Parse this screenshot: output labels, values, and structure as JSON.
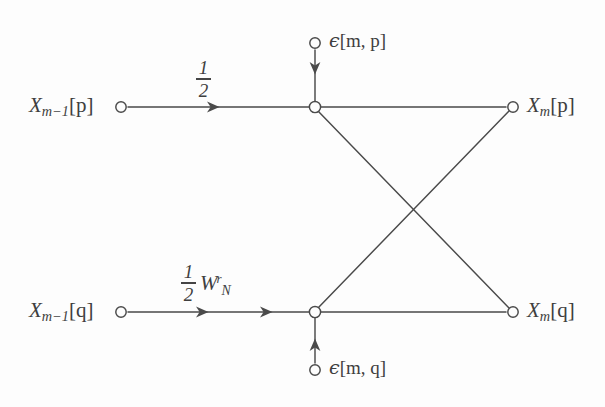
{
  "figure": {
    "kind": "signal-flow-graph",
    "background_color": "#fdfdfd",
    "line_color": "#4a4a4a",
    "text_color": "#3f3f3f"
  },
  "nodes": {
    "input_top": {
      "label_x": "X",
      "label_sub": "m−1",
      "label_index": "[p]",
      "x": 121,
      "y": 107
    },
    "input_bottom": {
      "label_x": "X",
      "label_sub": "m−1",
      "label_index": "[q]",
      "x": 121,
      "y": 312
    },
    "junction_top": {
      "x": 315,
      "y": 107
    },
    "junction_bottom": {
      "x": 315,
      "y": 312
    },
    "output_top": {
      "label_x": "X",
      "label_sub": "m",
      "label_index": "[p]",
      "x": 513,
      "y": 107
    },
    "output_bottom": {
      "label_x": "X",
      "label_sub": "m",
      "label_index": "[q]",
      "x": 513,
      "y": 312
    },
    "noise_top": {
      "x": 315,
      "y": 43
    },
    "noise_bottom": {
      "x": 315,
      "y": 370
    }
  },
  "labels": {
    "input_top": "X",
    "input_top_sub": "m−1",
    "input_top_index": "[p]",
    "input_bottom": "X",
    "input_bottom_sub": "m−1",
    "input_bottom_index": "[q]",
    "output_top": "X",
    "output_top_sub": "m",
    "output_top_index": "[p]",
    "output_bottom": "X",
    "output_bottom_sub": "m",
    "output_bottom_index": "[q]",
    "noise_top_symbol": "ϵ",
    "noise_top_args": "[m, p]",
    "noise_bottom_symbol": "ϵ",
    "noise_bottom_args": "[m, q]"
  },
  "gains": {
    "top_branch": {
      "numerator": "1",
      "denominator": "2",
      "twiddle": null,
      "arrowheads": 1
    },
    "bottom_branch": {
      "numerator": "1",
      "denominator": "2",
      "twiddle_base": "W",
      "twiddle_sub": "N",
      "twiddle_sup": "r",
      "arrowheads": 2
    }
  },
  "edges": [
    {
      "name": "input-top-to-junction-top",
      "from": "input_top",
      "to": "junction_top",
      "gain": "1/2",
      "directed": true
    },
    {
      "name": "input-bottom-to-junction-bottom",
      "from": "input_bottom",
      "to": "junction_bottom",
      "gain": "1/2 W_N^r",
      "directed": true
    },
    {
      "name": "noise-top-into-junction-top",
      "from": "noise_top",
      "to": "junction_top",
      "gain": "1",
      "directed": true
    },
    {
      "name": "noise-bottom-into-junction-bottom",
      "from": "noise_bottom",
      "to": "junction_bottom",
      "gain": "1",
      "directed": true
    },
    {
      "name": "junction-top-to-output-top",
      "from": "junction_top",
      "to": "output_top",
      "gain": "1",
      "directed": false
    },
    {
      "name": "junction-bottom-to-output-bottom",
      "from": "junction_bottom",
      "to": "output_bottom",
      "gain": "1",
      "directed": false
    },
    {
      "name": "junction-top-to-output-bottom",
      "from": "junction_top",
      "to": "output_bottom",
      "gain": "1",
      "directed": false
    },
    {
      "name": "junction-bottom-to-output-top",
      "from": "junction_bottom",
      "to": "output_top",
      "gain": "1",
      "directed": false
    }
  ]
}
